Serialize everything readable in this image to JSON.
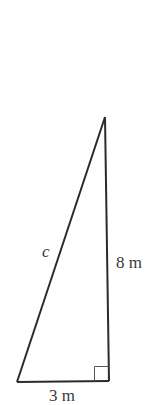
{
  "diagram": {
    "type": "right-triangle",
    "labels": {
      "hypotenuse": "c",
      "vertical_leg": "8 m",
      "base": "3 m"
    },
    "colors": {
      "stroke": "#2b2b2b",
      "right_angle_marker": "#555555",
      "text": "#3a3a3a"
    },
    "vertices": {
      "apex": [
        105,
        117
      ],
      "bottom_left": [
        17,
        382
      ],
      "bottom_right": [
        109,
        381
      ]
    }
  }
}
